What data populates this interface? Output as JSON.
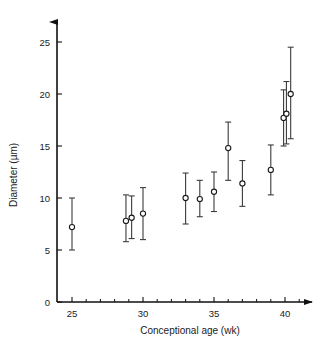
{
  "chart_data": {
    "type": "scatter",
    "title": "",
    "xlabel": "Conceptional age (wk)",
    "ylabel": "Diameter (µm)",
    "xlim": [
      24,
      41.5
    ],
    "ylim": [
      0,
      26.5
    ],
    "xticks": [
      25,
      30,
      35,
      40
    ],
    "xtick_labels": [
      "25",
      "30",
      "35",
      "40"
    ],
    "xtick_minor_step": 1,
    "yticks": [
      0,
      5,
      10,
      15,
      20,
      25
    ],
    "ytick_labels": [
      "0",
      "5",
      "10",
      "15",
      "20",
      "25"
    ],
    "grid": false,
    "legend": null,
    "marker": "open-circle",
    "errorbar_style": "vertical-line-with-caps",
    "points": [
      {
        "x": 25.0,
        "y": 7.2,
        "y_low": 5.0,
        "y_high": 10.0
      },
      {
        "x": 28.8,
        "y": 7.8,
        "y_low": 5.8,
        "y_high": 10.3
      },
      {
        "x": 29.2,
        "y": 8.1,
        "y_low": 6.1,
        "y_high": 10.2
      },
      {
        "x": 30.0,
        "y": 8.5,
        "y_low": 6.0,
        "y_high": 11.0
      },
      {
        "x": 33.0,
        "y": 10.0,
        "y_low": 7.5,
        "y_high": 12.4
      },
      {
        "x": 34.0,
        "y": 9.9,
        "y_low": 8.2,
        "y_high": 11.7
      },
      {
        "x": 35.0,
        "y": 10.6,
        "y_low": 8.7,
        "y_high": 12.5
      },
      {
        "x": 36.0,
        "y": 14.8,
        "y_low": 11.7,
        "y_high": 17.3
      },
      {
        "x": 37.0,
        "y": 11.4,
        "y_low": 9.2,
        "y_high": 13.6
      },
      {
        "x": 39.0,
        "y": 12.7,
        "y_low": 10.3,
        "y_high": 15.1
      },
      {
        "x": 39.9,
        "y": 17.7,
        "y_low": 15.0,
        "y_high": 20.4
      },
      {
        "x": 40.1,
        "y": 18.1,
        "y_low": 15.2,
        "y_high": 21.2
      },
      {
        "x": 40.4,
        "y": 20.0,
        "y_low": 15.7,
        "y_high": 24.5
      }
    ]
  },
  "axes": {
    "x_axis_name": "conceptional-age-axis",
    "y_axis_name": "diameter-axis"
  }
}
